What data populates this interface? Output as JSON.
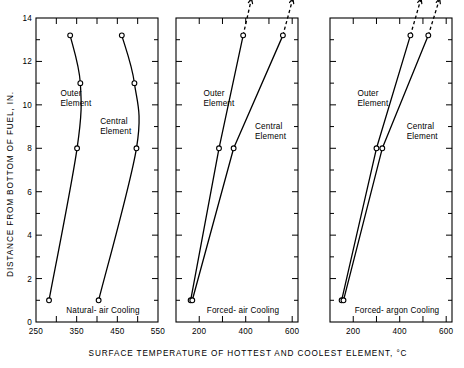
{
  "chart_data": {
    "type": "line",
    "title": "",
    "xlabel": "SURFACE TEMPERATURE OF HOTTEST AND COOLEST ELEMENT, °C",
    "ylabel": "DISTANCE FROM BOTTOM OF FUEL, IN.",
    "ylim": [
      0,
      14
    ],
    "ytick_labels": [
      "0",
      "2",
      "4",
      "6",
      "8",
      "10",
      "12",
      "14"
    ],
    "ytick_values": [
      0,
      2,
      4,
      6,
      8,
      10,
      12,
      14
    ],
    "yminor_values": [
      1,
      3,
      5,
      7,
      9,
      11,
      13
    ],
    "grid": false,
    "legend_position": "inline-annotations",
    "panels": [
      {
        "name": "natural-air",
        "caption": "Natural- air  Cooling",
        "xlim": [
          250,
          550
        ],
        "xtick_values": [
          250,
          300,
          350,
          400,
          450,
          500,
          550
        ],
        "xtick_labels": [
          "250",
          "",
          "350",
          "",
          "450",
          "",
          "550"
        ],
        "annotations": [
          {
            "text_line1": "Outer",
            "text_line2": "Element",
            "x": 310,
            "y": 10.4
          },
          {
            "text_line1": "Central",
            "text_line2": "Element",
            "x": 408,
            "y": 9.1
          }
        ],
        "series": [
          {
            "name": "Outer Element",
            "style": "solid-curved",
            "points": [
              {
                "x": 334,
                "y": 13.2
              },
              {
                "x": 359,
                "y": 11.0
              },
              {
                "x": 351,
                "y": 8.0
              },
              {
                "x": 282,
                "y": 1.0
              }
            ]
          },
          {
            "name": "Central Element",
            "style": "solid-curved",
            "points": [
              {
                "x": 461,
                "y": 13.2
              },
              {
                "x": 492,
                "y": 11.0
              },
              {
                "x": 497,
                "y": 8.0
              },
              {
                "x": 404,
                "y": 1.0
              }
            ]
          }
        ]
      },
      {
        "name": "forced-air",
        "caption": "Forced- air  Cooling",
        "xlim": [
          100,
          625
        ],
        "xtick_values": [
          200,
          300,
          400,
          500,
          600
        ],
        "xtick_labels": [
          "200",
          "",
          "400",
          "",
          "600"
        ],
        "annotations": [
          {
            "text_line1": "Outer",
            "text_line2": "Element",
            "x": 218,
            "y": 10.4
          },
          {
            "text_line1": "Central",
            "text_line2": "Element",
            "x": 440,
            "y": 8.9
          }
        ],
        "series": [
          {
            "name": "Outer Element",
            "style": "solid-extended",
            "points": [
              {
                "x": 389,
                "y": 13.2
              },
              {
                "x": 285,
                "y": 8.0
              },
              {
                "x": 163,
                "y": 1.0
              }
            ],
            "extension_to": {
              "x": 425,
              "y": 14.9
            }
          },
          {
            "name": "Central Element",
            "style": "solid-extended",
            "points": [
              {
                "x": 560,
                "y": 13.2
              },
              {
                "x": 348,
                "y": 8.0
              },
              {
                "x": 170,
                "y": 1.0
              }
            ],
            "extension_to": {
              "x": 603,
              "y": 14.9
            }
          }
        ]
      },
      {
        "name": "forced-argon",
        "caption": "Forced- argon  Cooling",
        "xlim": [
          100,
          625
        ],
        "xtick_values": [
          200,
          300,
          400,
          500,
          600
        ],
        "xtick_labels": [
          "200",
          "",
          "400",
          "",
          "600"
        ],
        "annotations": [
          {
            "text_line1": "Outer",
            "text_line2": "Element",
            "x": 218,
            "y": 10.4
          },
          {
            "text_line1": "Central",
            "text_line2": "Element",
            "x": 430,
            "y": 8.9
          }
        ],
        "series": [
          {
            "name": "Outer Element",
            "style": "solid-extended",
            "points": [
              {
                "x": 446,
                "y": 13.2
              },
              {
                "x": 300,
                "y": 8.0
              },
              {
                "x": 150,
                "y": 1.0
              }
            ],
            "extension_to": {
              "x": 492,
              "y": 14.9
            }
          },
          {
            "name": "Central Element",
            "style": "solid-extended",
            "points": [
              {
                "x": 523,
                "y": 13.2
              },
              {
                "x": 325,
                "y": 8.0
              },
              {
                "x": 158,
                "y": 1.0
              }
            ],
            "extension_to": {
              "x": 572,
              "y": 14.9
            }
          }
        ]
      }
    ]
  }
}
